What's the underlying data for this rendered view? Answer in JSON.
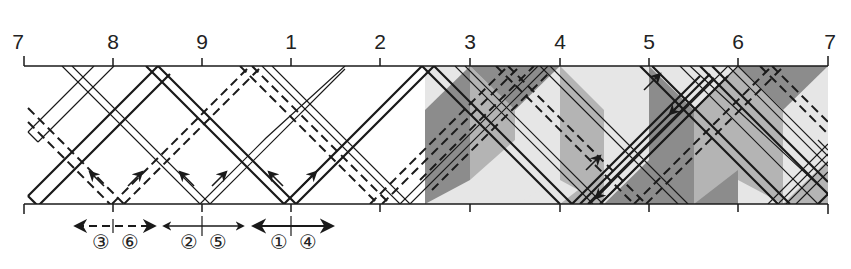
{
  "axis": {
    "ticks": [
      {
        "label": "7",
        "x": 24
      },
      {
        "label": "8",
        "x": 113
      },
      {
        "label": "9",
        "x": 202
      },
      {
        "label": "1",
        "x": 291
      },
      {
        "label": "2",
        "x": 380
      },
      {
        "label": "3",
        "x": 470
      },
      {
        "label": "4",
        "x": 560
      },
      {
        "label": "5",
        "x": 649
      },
      {
        "label": "6",
        "x": 738
      },
      {
        "label": "7",
        "x": 828
      }
    ]
  },
  "strip_groups": [
    {
      "labels": [
        "③",
        "⑥"
      ],
      "center_x": 113,
      "style": "dashed"
    },
    {
      "labels": [
        "②",
        "⑤"
      ],
      "center_x": 202,
      "style": "thin"
    },
    {
      "labels": [
        "①",
        "④"
      ],
      "center_x": 291,
      "style": "thick"
    }
  ],
  "legend": {
    "group_a": {
      "left": "③",
      "right": "⑥"
    },
    "group_b": {
      "left": "②",
      "right": "⑤"
    },
    "group_c": {
      "left": "①",
      "right": "④"
    }
  },
  "colors": {
    "line": "#1a1a1a",
    "shade_dark": "#8c8c8c",
    "shade_mid": "#b4b4b4",
    "shade_light": "#e6e6e6",
    "background": "#ffffff"
  },
  "shaded_region": {
    "x_start": 425,
    "x_end": 828
  }
}
